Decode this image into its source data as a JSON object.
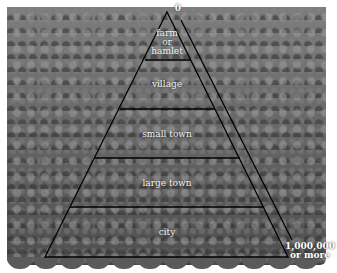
{
  "diagram": {
    "type": "population-pyramid-of-settlements",
    "apex_label": "0",
    "base_label": "1,000,000\nor more",
    "base_label_lines": [
      "1,000,000",
      "or more"
    ],
    "levels": [
      {
        "lines": [
          "farm",
          "or",
          "hamlet"
        ]
      },
      {
        "lines": [
          "village"
        ]
      },
      {
        "lines": [
          "small town"
        ]
      },
      {
        "lines": [
          "large town"
        ]
      },
      {
        "lines": [
          "city"
        ]
      }
    ],
    "colors": {
      "line": "#000000",
      "label_text": "#f2f2f2",
      "background_photo": "#6a6a6a"
    }
  }
}
